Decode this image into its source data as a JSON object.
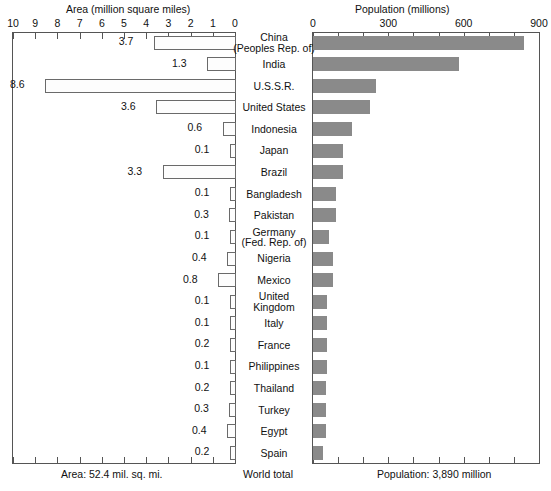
{
  "chart_data": {
    "type": "bar",
    "title": "",
    "orientation": "horizontal-bidirectional",
    "left_panel": {
      "title": "Area (million square miles)",
      "axis_label": "Area (million square miles)",
      "direction": "right-to-left",
      "ticks": [
        10,
        9,
        8,
        7,
        6,
        5,
        4,
        3,
        2,
        1,
        0
      ],
      "xlim": [
        10,
        0
      ],
      "grid": false,
      "bar_fill": "stippled-dots",
      "footer": "Area: 52.4 mil. sq. mi."
    },
    "right_panel": {
      "title": "Population (millions)",
      "axis_label": "Population (millions)",
      "direction": "left-to-right",
      "ticks": [
        0,
        300,
        600,
        900
      ],
      "minor_tick_step": 100,
      "xlim": [
        0,
        900
      ],
      "grid": false,
      "bar_color": "#8a8a8a",
      "footer": "Population: 3,890 million"
    },
    "center_footer": "World total",
    "categories": [
      "China (Peoples Rep. of)",
      "India",
      "U.S.S.R.",
      "United States",
      "Indonesia",
      "Japan",
      "Brazil",
      "Bangladesh",
      "Pakistan",
      "Germany (Fed. Rep. of)",
      "Nigeria",
      "Mexico",
      "United Kingdom",
      "Italy",
      "France",
      "Philippines",
      "Thailand",
      "Turkey",
      "Egypt",
      "Spain"
    ],
    "series": [
      {
        "name": "Area (million square miles)",
        "values": [
          3.7,
          1.3,
          8.6,
          3.6,
          0.6,
          0.1,
          3.3,
          0.1,
          0.3,
          0.1,
          0.4,
          0.8,
          0.1,
          0.1,
          0.2,
          0.1,
          0.2,
          0.3,
          0.4,
          0.2
        ]
      },
      {
        "name": "Population (millions)",
        "values": [
          840,
          580,
          250,
          225,
          155,
          120,
          120,
          90,
          90,
          62,
          80,
          80,
          56,
          57,
          55,
          56,
          50,
          52,
          52,
          39
        ]
      }
    ]
  },
  "rows": [
    {
      "name_lines": [
        "China",
        "(Peoples Rep. of)"
      ],
      "area": "3.7",
      "area_value": 3.7,
      "pop_value": 840
    },
    {
      "name_lines": [
        "India"
      ],
      "area": "1.3",
      "area_value": 1.3,
      "pop_value": 580
    },
    {
      "name_lines": [
        "U.S.S.R."
      ],
      "area": "8.6",
      "area_value": 8.6,
      "pop_value": 250
    },
    {
      "name_lines": [
        "United States"
      ],
      "area": "3.6",
      "area_value": 3.6,
      "pop_value": 225
    },
    {
      "name_lines": [
        "Indonesia"
      ],
      "area": "0.6",
      "area_value": 0.6,
      "pop_value": 155
    },
    {
      "name_lines": [
        "Japan"
      ],
      "area": "0.1",
      "area_value": 0.1,
      "pop_value": 120
    },
    {
      "name_lines": [
        "Brazil"
      ],
      "area": "3.3",
      "area_value": 3.3,
      "pop_value": 120
    },
    {
      "name_lines": [
        "Bangladesh"
      ],
      "area": "0.1",
      "area_value": 0.1,
      "pop_value": 90
    },
    {
      "name_lines": [
        "Pakistan"
      ],
      "area": "0.3",
      "area_value": 0.3,
      "pop_value": 90
    },
    {
      "name_lines": [
        "Germany",
        "(Fed. Rep. of)"
      ],
      "area": "0.1",
      "area_value": 0.1,
      "pop_value": 62
    },
    {
      "name_lines": [
        "Nigeria"
      ],
      "area": "0.4",
      "area_value": 0.4,
      "pop_value": 80
    },
    {
      "name_lines": [
        "Mexico"
      ],
      "area": "0.8",
      "area_value": 0.8,
      "pop_value": 80
    },
    {
      "name_lines": [
        "United",
        "Kingdom"
      ],
      "area": "0.1",
      "area_value": 0.1,
      "pop_value": 56
    },
    {
      "name_lines": [
        "Italy"
      ],
      "area": "0.1",
      "area_value": 0.1,
      "pop_value": 57
    },
    {
      "name_lines": [
        "France"
      ],
      "area": "0.2",
      "area_value": 0.2,
      "pop_value": 55
    },
    {
      "name_lines": [
        "Philippines"
      ],
      "area": "0.1",
      "area_value": 0.1,
      "pop_value": 56
    },
    {
      "name_lines": [
        "Thailand"
      ],
      "area": "0.2",
      "area_value": 0.2,
      "pop_value": 50
    },
    {
      "name_lines": [
        "Turkey"
      ],
      "area": "0.3",
      "area_value": 0.3,
      "pop_value": 52
    },
    {
      "name_lines": [
        "Egypt"
      ],
      "area": "0.4",
      "area_value": 0.4,
      "pop_value": 52
    },
    {
      "name_lines": [
        "Spain"
      ],
      "area": "0.2",
      "area_value": 0.2,
      "pop_value": 39
    }
  ],
  "left_axis": {
    "title": "Area (million square miles)",
    "tick_labels": [
      "10",
      "9",
      "8",
      "7",
      "6",
      "5",
      "4",
      "3",
      "2",
      "1",
      "0"
    ]
  },
  "right_axis": {
    "title": "Population (millions)",
    "tick_labels": [
      "0",
      "300",
      "600",
      "900"
    ]
  },
  "footer": {
    "area_total": "Area: 52.4 mil. sq. mi.",
    "world_total": "World total",
    "population_total": "Population: 3,890 million"
  }
}
